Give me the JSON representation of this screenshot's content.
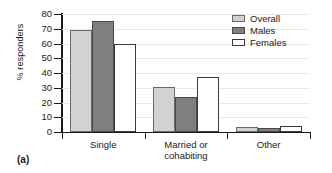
{
  "chart_data": {
    "type": "bar",
    "title": "",
    "subtitle": "",
    "xlabel": "",
    "ylabel": "% responders",
    "ylim": [
      0,
      80
    ],
    "ytick_step": 10,
    "yticks": [
      "80",
      "70",
      "60",
      "50",
      "40",
      "30",
      "20",
      "10",
      "0"
    ],
    "grid": true,
    "grid_axis": "y",
    "legend_position": "top-right",
    "categories": [
      "Single",
      "Married or cohabiting",
      "Other"
    ],
    "category_lines": [
      [
        "Single"
      ],
      [
        "Married or",
        "cohabiting"
      ],
      [
        "Other"
      ]
    ],
    "series": [
      {
        "name": "Overall",
        "color": "#d2d2d2",
        "values": [
          69,
          30.5,
          3.5
        ]
      },
      {
        "name": "Males",
        "color": "#7f7f7f",
        "values": [
          75,
          23.5,
          2.8
        ]
      },
      {
        "name": "Females",
        "color": "#ffffff",
        "values": [
          60,
          37.5,
          4.0
        ]
      }
    ]
  },
  "figure": {
    "caption": "(a)"
  },
  "legend": {
    "entries": [
      {
        "label": "Overall"
      },
      {
        "label": "Males"
      },
      {
        "label": "Females"
      }
    ]
  }
}
